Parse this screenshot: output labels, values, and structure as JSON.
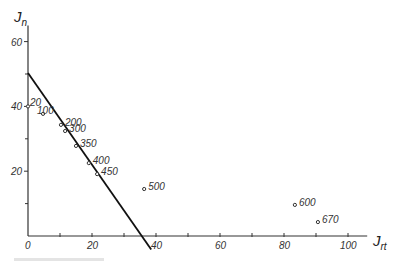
{
  "chart_data": {
    "type": "scatter",
    "title": "",
    "xlabel": "J",
    "xlabel_sub": "rt",
    "ylabel": "J",
    "ylabel_sub": "n",
    "xlim": [
      0,
      106
    ],
    "ylim": [
      0,
      65
    ],
    "x_ticks_major": [
      0,
      20,
      40,
      60,
      80,
      100
    ],
    "x_ticks_minor": [
      10,
      30,
      50,
      70,
      90
    ],
    "y_ticks_major": [
      20,
      40,
      60
    ],
    "y_ticks_minor": [
      10,
      30,
      50
    ],
    "grid": false,
    "series": [
      {
        "name": "measurements",
        "points": [
          {
            "label": "20",
            "x": 0.0,
            "y": 40.0
          },
          {
            "label": "100",
            "x": 4.7,
            "y": 37.7
          },
          {
            "label": "200",
            "x": 10.3,
            "y": 34.3
          },
          {
            "label": "300",
            "x": 11.6,
            "y": 32.4
          },
          {
            "label": "350",
            "x": 15.0,
            "y": 27.8
          },
          {
            "label": "400",
            "x": 19.0,
            "y": 22.5
          },
          {
            "label": "450",
            "x": 21.6,
            "y": 19.1
          },
          {
            "label": "500",
            "x": 36.3,
            "y": 14.5
          },
          {
            "label": "600",
            "x": 83.4,
            "y": 9.6
          },
          {
            "label": "670",
            "x": 90.6,
            "y": 4.3
          }
        ]
      }
    ],
    "fit_line": {
      "name": "linear fit",
      "from": {
        "x": 0,
        "y": 50.3
      },
      "to": {
        "x": 38.5,
        "y": -4.2
      }
    },
    "caption": ""
  }
}
